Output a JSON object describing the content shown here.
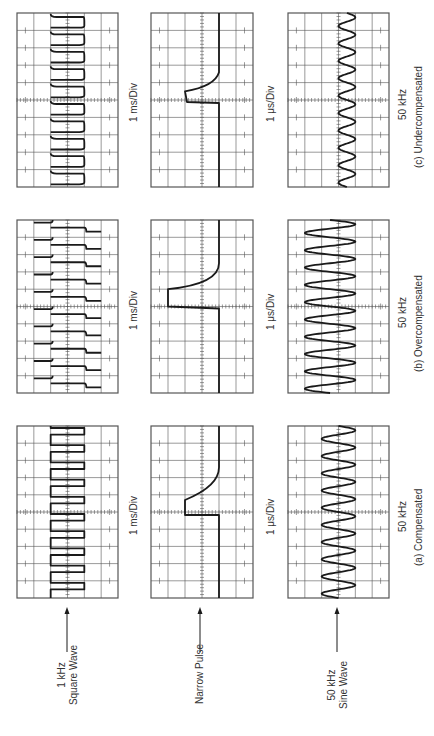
{
  "figure": {
    "orientation": "rotated-90-ccw",
    "ink_color": "#1a1a1a",
    "grid_color": "#555555",
    "background": "#ffffff"
  },
  "inputs": [
    {
      "id": "square",
      "label_line1": "1 kHz",
      "label_line2": "Square Wave"
    },
    {
      "id": "pulse",
      "label_line1": "Narrow Pulse",
      "label_line2": ""
    },
    {
      "id": "sine",
      "label_line1": "50 kHz",
      "label_line2": "Sine Wave"
    }
  ],
  "timebase_labels": {
    "square": "1 ms/Div",
    "pulse": "1 μs/Div",
    "sine": "50 kHz"
  },
  "conditions": [
    {
      "id": "a",
      "caption": "(a)  Compensated"
    },
    {
      "id": "b",
      "caption": "(b)  Overcompensated"
    },
    {
      "id": "c",
      "caption": "(c)  Undercompensated"
    }
  ],
  "graticule": {
    "horizontal_divisions": 10,
    "vertical_divisions": 6
  },
  "panels": {
    "c": {
      "square": {
        "shape": "undercompensated-square",
        "cycles": 10
      },
      "pulse": {
        "shape": "undercompensated-pulse"
      },
      "sine": {
        "shape": "sine",
        "cycles": 10,
        "amplitude_divs": 1.0
      }
    },
    "b": {
      "square": {
        "shape": "overcompensated-square",
        "cycles": 10
      },
      "pulse": {
        "shape": "overcompensated-pulse"
      },
      "sine": {
        "shape": "sine",
        "cycles": 10,
        "amplitude_divs": 3.0
      }
    },
    "a": {
      "square": {
        "shape": "compensated-square",
        "cycles": 10
      },
      "pulse": {
        "shape": "compensated-pulse"
      },
      "sine": {
        "shape": "sine",
        "cycles": 10,
        "amplitude_divs": 2.0
      }
    }
  }
}
